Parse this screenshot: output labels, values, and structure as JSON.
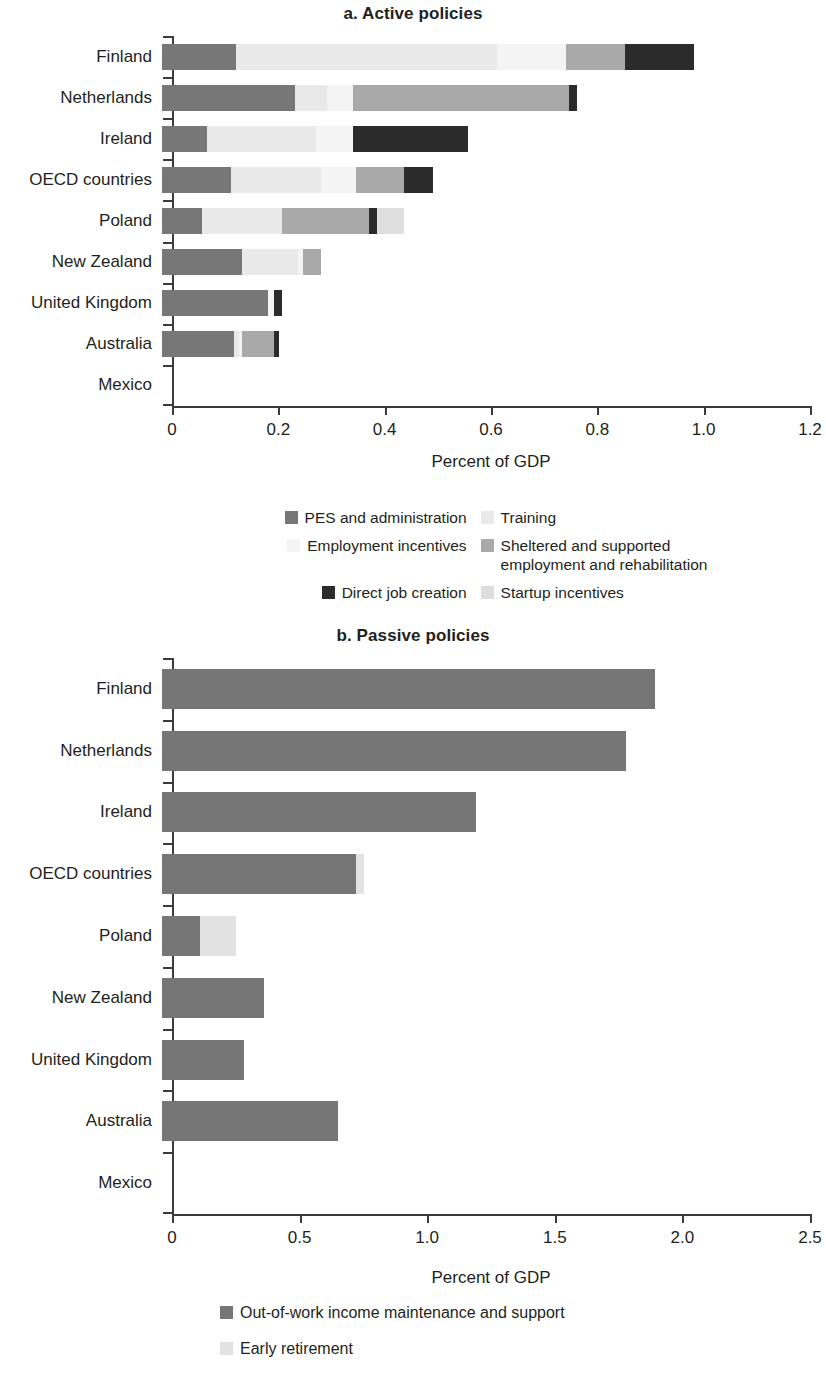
{
  "colors": {
    "pes": "#777777",
    "training": "#e9e9e9",
    "employment_incentives": "#f4f4f4",
    "sheltered": "#a9a9a9",
    "direct_job_creation": "#2b2b2b",
    "startup": "#dedede",
    "out_of_work": "#767676",
    "early_retirement": "#e2e2e2",
    "axis": "#3b3b3b",
    "text": "#231f20"
  },
  "panel_a": {
    "title": "a. Active policies",
    "xlabel": "Percent of GDP",
    "xticks": [
      "0",
      "0.2",
      "0.4",
      "0.6",
      "0.8",
      "1.0",
      "1.2"
    ],
    "legend": [
      {
        "label": "PES and administration",
        "color_key": "pes",
        "has_swatch": true
      },
      {
        "label": "Training",
        "color_key": "training",
        "has_swatch": true
      },
      {
        "label": "Employment incentives",
        "color_key": "employment_incentives",
        "has_swatch": true
      },
      {
        "label": "Sheltered and supported\nemployment and rehabilitation",
        "color_key": "sheltered",
        "has_swatch": true
      },
      {
        "label": "Direct job creation",
        "color_key": "direct_job_creation",
        "has_swatch": true
      },
      {
        "label": "Startup incentives",
        "color_key": "startup",
        "has_swatch": true
      }
    ]
  },
  "panel_b": {
    "title": "b. Passive policies",
    "xlabel": "Percent of GDP",
    "xticks": [
      "0",
      "0.5",
      "1.0",
      "1.5",
      "2.0",
      "2.5"
    ],
    "legend": [
      {
        "label": "Out-of-work income maintenance and support",
        "color_key": "out_of_work"
      },
      {
        "label": "Early retirement",
        "color_key": "early_retirement"
      }
    ]
  },
  "chart_data": [
    {
      "type": "bar",
      "orientation": "horizontal",
      "stacked": true,
      "title": "a. Active policies",
      "xlabel": "Percent of GDP",
      "ylabel": "",
      "xlim": [
        0,
        1.2
      ],
      "xticks": [
        0,
        0.2,
        0.4,
        0.6,
        0.8,
        1.0,
        1.2
      ],
      "grid": false,
      "legend_position": "below",
      "categories": [
        "Finland",
        "Netherlands",
        "Ireland",
        "OECD countries",
        "Poland",
        "New Zealand",
        "United Kingdom",
        "Australia",
        "Mexico"
      ],
      "series": [
        {
          "name": "PES and administration",
          "values": [
            0.14,
            0.25,
            0.085,
            0.13,
            0.075,
            0.15,
            0.2,
            0.135,
            0.0
          ]
        },
        {
          "name": "Training",
          "values": [
            0.49,
            0.06,
            0.205,
            0.17,
            0.15,
            0.105,
            0.0,
            0.01,
            0.0
          ]
        },
        {
          "name": "Employment incentives",
          "values": [
            0.13,
            0.05,
            0.07,
            0.065,
            0.0,
            0.01,
            0.01,
            0.005,
            0.0
          ]
        },
        {
          "name": "Sheltered and supported employment and rehabilitation",
          "values": [
            0.11,
            0.405,
            0.0,
            0.09,
            0.165,
            0.035,
            0.0,
            0.06,
            0.0
          ]
        },
        {
          "name": "Direct job creation",
          "values": [
            0.13,
            0.015,
            0.215,
            0.055,
            0.015,
            0.0,
            0.015,
            0.01,
            0.0
          ]
        },
        {
          "name": "Startup incentives",
          "values": [
            0.0,
            0.0,
            0.0,
            0.0,
            0.05,
            0.0,
            0.0,
            0.0,
            0.0
          ]
        }
      ],
      "totals": [
        1.0,
        0.78,
        0.575,
        0.51,
        0.455,
        0.3,
        0.225,
        0.22,
        0.0
      ]
    },
    {
      "type": "bar",
      "orientation": "horizontal",
      "stacked": true,
      "title": "b. Passive policies",
      "xlabel": "Percent of GDP",
      "ylabel": "",
      "xlim": [
        0,
        2.5
      ],
      "xticks": [
        0,
        0.5,
        1.0,
        1.5,
        2.0,
        2.5
      ],
      "grid": false,
      "legend_position": "below",
      "categories": [
        "Finland",
        "Netherlands",
        "Ireland",
        "OECD countries",
        "Poland",
        "New Zealand",
        "United Kingdom",
        "Australia",
        "Mexico"
      ],
      "series": [
        {
          "name": "Out-of-work income maintenance and support",
          "values": [
            1.93,
            1.82,
            1.23,
            0.76,
            0.15,
            0.4,
            0.32,
            0.69,
            0.0
          ]
        },
        {
          "name": "Early retirement",
          "values": [
            0.0,
            0.0,
            0.0,
            0.03,
            0.14,
            0.0,
            0.0,
            0.0,
            0.0
          ]
        }
      ],
      "totals": [
        1.93,
        1.82,
        1.23,
        0.79,
        0.29,
        0.4,
        0.32,
        0.69,
        0.0
      ]
    }
  ]
}
